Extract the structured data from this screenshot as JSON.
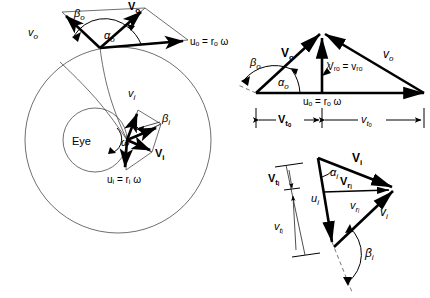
{
  "figure": {
    "type": "technical-vector-diagram",
    "background": "#ffffff",
    "line_color": "#000000",
    "guide_color": "#4a4a4a"
  },
  "main_view": {
    "name": "rotor-plan-view",
    "eye_label": "Eye",
    "omega_label": "ω",
    "circles": [
      {
        "name": "outer-radius-circle",
        "cx": 118,
        "cy": 140,
        "r": 93
      },
      {
        "name": "eye-circle",
        "cx": 95,
        "cy": 140,
        "r": 32
      }
    ],
    "streamline": {
      "name": "streamline-curve"
    },
    "outer_station": {
      "origin_x": 100,
      "origin_y": 48,
      "vectors": [
        {
          "name": "V-o-absolute",
          "label": "V",
          "sub": "o"
        },
        {
          "name": "v-o-relative",
          "label": "v",
          "sub": "o",
          "italic": true
        },
        {
          "name": "u-o-blade",
          "label": "u",
          "sub": "o",
          "italic": true
        }
      ],
      "u_equation": "uₒ = rₒ ω",
      "angles": [
        {
          "name": "alpha-o-angle",
          "label": "α",
          "sub": "o"
        },
        {
          "name": "beta-o-angle",
          "label": "β",
          "sub": "o"
        }
      ]
    },
    "inner_station": {
      "origin_x": 127,
      "origin_y": 140,
      "vectors": [
        {
          "name": "V-i-absolute",
          "label": "V",
          "sub": "i"
        },
        {
          "name": "v-i-relative",
          "label": "v",
          "sub": "i",
          "italic": true
        },
        {
          "name": "u-i-blade",
          "label": "u",
          "sub": "i",
          "italic": true
        }
      ],
      "u_equation": "uᵢ = rᵢ ω",
      "angles": [
        {
          "name": "beta-i-angle",
          "label": "β",
          "sub": "i"
        }
      ]
    }
  },
  "outer_triangle": {
    "name": "outer-velocity-triangle",
    "labels": {
      "V_abs": {
        "base": "V",
        "sub": "o"
      },
      "v_rel": {
        "base": "v",
        "sub": "o"
      },
      "u_blade_eq": "uₒ = rₒ ω",
      "radial_eq": "Vᵣₒ = vᵣₒ",
      "alpha": {
        "base": "α",
        "sub": "o"
      },
      "beta": {
        "base": "β",
        "sub": "o"
      }
    },
    "dimensions": [
      {
        "name": "dim-Vt-o",
        "base": "V",
        "sub": "tₒ"
      },
      {
        "name": "dim-vt-o",
        "base": "v",
        "sub": "tₒ"
      }
    ]
  },
  "inner_triangle": {
    "name": "inner-velocity-triangle",
    "labels": {
      "V_abs": {
        "base": "V",
        "sub": "i"
      },
      "v_rel": {
        "base": "v",
        "sub": "i"
      },
      "u_blade": {
        "base": "u",
        "sub": "i"
      },
      "V_radial": {
        "base": "V",
        "sub": "rᵢ"
      },
      "v_radial": {
        "base": "v",
        "sub": "rᵢ"
      },
      "alpha": {
        "base": "α",
        "sub": "i"
      },
      "beta": {
        "base": "β",
        "sub": "i"
      }
    },
    "dimensions": [
      {
        "name": "dim-Vt-i",
        "base": "V",
        "sub": "tᵢ"
      },
      {
        "name": "dim-vt-i",
        "base": "v",
        "sub": "tᵢ"
      }
    ]
  },
  "text": {
    "eye": "Eye",
    "omega": "ω",
    "uo_eq": "uₒ = rₒ ω",
    "ui_eq": "uᵢ = rᵢ ω",
    "vro_eq": "Vᵣₒ = vᵣₒ",
    "V": "V",
    "v": "v",
    "u": "u",
    "alpha": "α",
    "beta": "β",
    "sub_o": "o",
    "sub_i": "i",
    "sub_ro": "rₒ",
    "sub_ri": "rᵢ",
    "sub_to": "tₒ",
    "sub_ti": "tᵢ"
  }
}
